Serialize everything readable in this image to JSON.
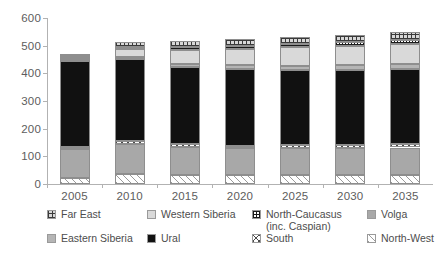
{
  "chart_data": {
    "type": "bar",
    "subtype": "stacked-vertical",
    "title": "",
    "subtitle": "",
    "xlabel": "",
    "ylabel": "",
    "categories": [
      "2005",
      "2010",
      "2015",
      "2020",
      "2025",
      "2030",
      "2035"
    ],
    "ylim": [
      0,
      600
    ],
    "yticks": [
      0,
      100,
      200,
      300,
      400,
      500,
      600
    ],
    "grid": false,
    "legend_position": "bottom",
    "stack_order_bottom_to_top": [
      "North-West",
      "Volga",
      "South",
      "Ural",
      "Eastern Siberia",
      "Western Siberia",
      "North-Caucasus (inc. Caspian)",
      "Far East"
    ],
    "series": [
      {
        "name": "North-West",
        "values": [
          22,
          35,
          33,
          33,
          33,
          33,
          33
        ]
      },
      {
        "name": "Volga",
        "values": [
          104,
          110,
          100,
          96,
          96,
          96,
          99
        ]
      },
      {
        "name": "South",
        "values": [
          8,
          10,
          10,
          10,
          11,
          11,
          11
        ]
      },
      {
        "name": "Ural",
        "values": [
          312,
          297,
          280,
          276,
          272,
          272,
          272
        ]
      },
      {
        "name": "Eastern Siberia",
        "values": [
          5,
          8,
          12,
          14,
          16,
          17,
          18
        ]
      },
      {
        "name": "Western Siberia",
        "values": [
          6,
          28,
          50,
          60,
          66,
          70,
          74
        ]
      },
      {
        "name": "North-Caucasus (inc. Caspian)",
        "values": [
          5,
          8,
          10,
          11,
          12,
          13,
          14
        ]
      },
      {
        "name": "Far East",
        "values": [
          4,
          19,
          22,
          24,
          26,
          28,
          30
        ]
      }
    ],
    "totals": [
      466,
      507,
      517,
      524,
      532,
      540,
      551
    ]
  },
  "axes": {
    "y_tick_labels": [
      "600",
      "500",
      "400",
      "300",
      "200",
      "100",
      "0"
    ],
    "x_tick_labels": [
      "2005",
      "2010",
      "2015",
      "2020",
      "2025",
      "2030",
      "2035"
    ]
  },
  "legend": {
    "items": [
      {
        "label": "Far East",
        "sub": "",
        "fill": "f-far-east",
        "icon": "swatch-grid-pattern"
      },
      {
        "label": "Western Siberia",
        "sub": "",
        "fill": "f-western-siberia",
        "icon": "swatch-light-gray"
      },
      {
        "label": "North-Caucasus",
        "sub": "(inc. Caspian)",
        "fill": "f-north-caucasus",
        "icon": "swatch-fine-grid-pattern"
      },
      {
        "label": "Volga",
        "sub": "",
        "fill": "f-volga",
        "icon": "swatch-mid-gray"
      },
      {
        "label": "Eastern Siberia",
        "sub": "",
        "fill": "f-eastern-siberia",
        "icon": "swatch-gray"
      },
      {
        "label": "Ural",
        "sub": "",
        "fill": "f-ural",
        "icon": "swatch-black"
      },
      {
        "label": "South",
        "sub": "",
        "fill": "f-south",
        "icon": "swatch-crosshatch-pattern"
      },
      {
        "label": "North-West",
        "sub": "",
        "fill": "f-north-west",
        "icon": "swatch-diagonal-stripes"
      }
    ]
  },
  "colors": {
    "axis": "#b2b2b2",
    "text": "#5a5a5a",
    "ural": "#111111",
    "volga": "#a8a8a8",
    "western_siberia": "#d9d9d9",
    "eastern_siberia": "#b5b5b5",
    "background": "#ffffff"
  }
}
